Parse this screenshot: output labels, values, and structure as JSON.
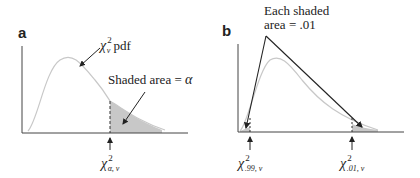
{
  "panel_a": {
    "letter": "a",
    "pdf_label_chi": "χ",
    "pdf_label_sup": "2",
    "pdf_label_sub": "ν",
    "pdf_label_text": " pdf",
    "shaded_label": "Shaded area = ",
    "shaded_symbol": "α",
    "critical_chi": "χ",
    "critical_sup": "2",
    "critical_sub": "α, ν"
  },
  "panel_b": {
    "letter": "b",
    "annotation_line1": "Each shaded",
    "annotation_line2": "area = .01",
    "left_chi": "χ",
    "left_sup": "2",
    "left_sub": ".99, ν",
    "right_chi": "χ",
    "right_sup": "2",
    "right_sub": ".01, ν"
  },
  "colors": {
    "curve": "#c8c8c8",
    "shade": "#c8c8c8",
    "axis": "#444444",
    "arrow": "#222222"
  }
}
